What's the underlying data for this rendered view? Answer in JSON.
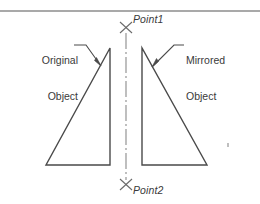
{
  "drawing": {
    "title_labels": {
      "original_object_line1": "Original",
      "original_object_line2": "Object",
      "mirrored_object_line1": "Mirrored",
      "mirrored_object_line2": "Object",
      "point1": "Point1",
      "point2": "Point2"
    },
    "colors": {
      "line": "#4a4a4a",
      "text": "#3a3a3a",
      "background": "#ffffff",
      "border": "#555555",
      "centerline": "#7a7a7a"
    },
    "geometry": {
      "border_line_y": 11,
      "mirror_axis_x": 126,
      "mirror_axis_top_y": 33,
      "mirror_axis_bottom_y": 180,
      "point1_marker": {
        "x": 126,
        "y": 27
      },
      "point2_marker": {
        "x": 126,
        "y": 184
      },
      "original_triangle": [
        {
          "x": 46,
          "y": 165
        },
        {
          "x": 110,
          "y": 165
        },
        {
          "x": 110,
          "y": 48
        }
      ],
      "mirrored_triangle": [
        {
          "x": 207,
          "y": 165
        },
        {
          "x": 142,
          "y": 165
        },
        {
          "x": 142,
          "y": 48
        }
      ],
      "original_leader": {
        "from_x": 74,
        "from_y": 45,
        "elbow_x": 86,
        "elbow_y": 45,
        "to_x": 101,
        "to_y": 66
      },
      "mirrored_leader": {
        "from_x": 184,
        "from_y": 45,
        "elbow_x": 174,
        "elbow_y": 45,
        "to_x": 152,
        "to_y": 67
      },
      "stray_tick": {
        "x": 228,
        "y": 145
      }
    }
  }
}
